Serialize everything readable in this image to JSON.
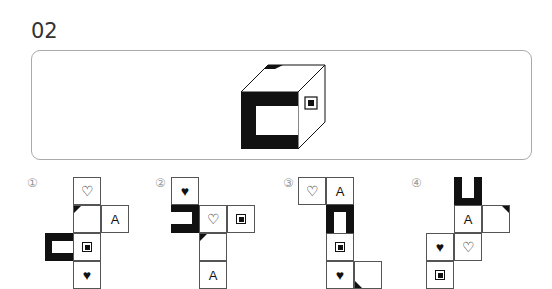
{
  "question": {
    "number": "02"
  },
  "cube": {
    "front_face": "thick-frame-open-right",
    "right_face": "square-in-square",
    "top_face": "corner-triangle"
  },
  "options": [
    {
      "label": "①",
      "cells": [
        {
          "row": 0,
          "col": 1,
          "symbol": "heart-outline",
          "text": "♡"
        },
        {
          "row": 1,
          "col": 1,
          "symbol": "corner-triangle-top-left",
          "text": ""
        },
        {
          "row": 1,
          "col": 2,
          "symbol": "letter",
          "text": "A"
        },
        {
          "row": 2,
          "col": 0,
          "symbol": "thick-frame-open-right",
          "text": ""
        },
        {
          "row": 2,
          "col": 1,
          "symbol": "square-in-square",
          "text": ""
        },
        {
          "row": 3,
          "col": 1,
          "symbol": "heart-filled",
          "text": "♥"
        }
      ]
    },
    {
      "label": "②",
      "cells": [
        {
          "row": 0,
          "col": 0,
          "symbol": "heart-filled",
          "text": "♥"
        },
        {
          "row": 1,
          "col": 0,
          "symbol": "thick-frame-open-right",
          "text": ""
        },
        {
          "row": 1,
          "col": 1,
          "symbol": "heart-outline",
          "text": "♡"
        },
        {
          "row": 1,
          "col": 2,
          "symbol": "square-in-square",
          "text": ""
        },
        {
          "row": 2,
          "col": 1,
          "symbol": "corner-triangle-top-left",
          "text": ""
        },
        {
          "row": 3,
          "col": 1,
          "symbol": "letter",
          "text": "A"
        }
      ]
    },
    {
      "label": "③",
      "cells": [
        {
          "row": 0,
          "col": 0,
          "symbol": "heart-outline",
          "text": "♡"
        },
        {
          "row": 0,
          "col": 1,
          "symbol": "letter",
          "text": "A"
        },
        {
          "row": 1,
          "col": 1,
          "symbol": "thick-frame-open-top",
          "text": ""
        },
        {
          "row": 2,
          "col": 1,
          "symbol": "square-in-square",
          "text": ""
        },
        {
          "row": 3,
          "col": 1,
          "symbol": "heart-filled",
          "text": "♥"
        },
        {
          "row": 3,
          "col": 2,
          "symbol": "corner-triangle-bottom-left",
          "text": ""
        }
      ]
    },
    {
      "label": "④",
      "cells": [
        {
          "row": 0,
          "col": 1,
          "symbol": "thick-frame-open-top",
          "text": ""
        },
        {
          "row": 1,
          "col": 1,
          "symbol": "letter",
          "text": "A"
        },
        {
          "row": 1,
          "col": 2,
          "symbol": "corner-triangle-top-right",
          "text": ""
        },
        {
          "row": 2,
          "col": 0,
          "symbol": "heart-filled",
          "text": "♥"
        },
        {
          "row": 2,
          "col": 1,
          "symbol": "heart-outline",
          "text": "♡"
        },
        {
          "row": 3,
          "col": 0,
          "symbol": "square-in-square",
          "text": ""
        }
      ]
    }
  ]
}
